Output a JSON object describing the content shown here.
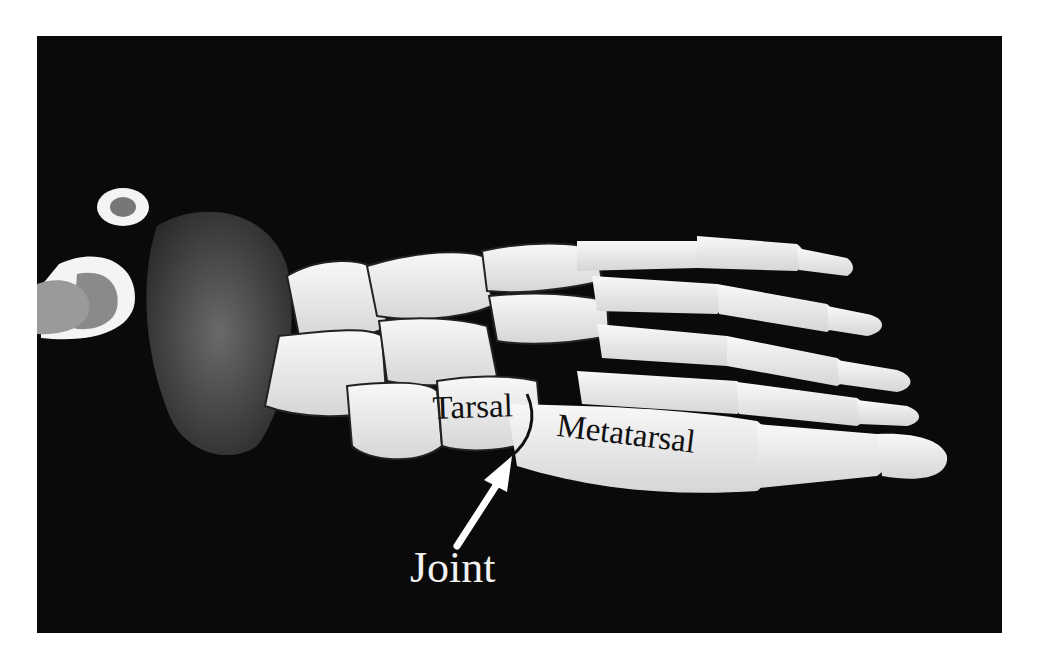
{
  "figure": {
    "background_color": "#0a0a0a",
    "bone_color": "#efefef",
    "labels": {
      "tarsal": "Tarsal",
      "metatarsal": "Metatarsal",
      "joint": "Joint"
    },
    "arrow": {
      "color": "#ffffff",
      "points_to": "joint"
    }
  }
}
